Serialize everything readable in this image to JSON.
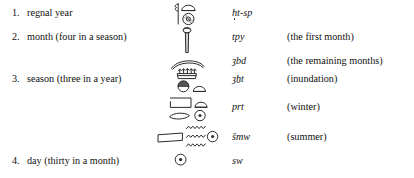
{
  "document": {
    "title": "Egyptian calendrical terms",
    "background_color": "#ffffff",
    "ink_color": "#2b2b2b"
  },
  "entries": [
    {
      "number": "1.",
      "label": "regnal year",
      "translit": "ḥȝt-sp",
      "translit_parts": {
        "base1": "h",
        "base2": "ȝ",
        "tail": "t-sp"
      },
      "gloss": "",
      "glyph_name": "palm-rib-with-sun-and-bread-glyph"
    },
    {
      "number": "2.",
      "label": "month (four in a season)",
      "translit": "tpy",
      "gloss": "(the first month)",
      "glyph_name": "crescent-on-pole-glyph"
    },
    {
      "number": "",
      "label": "",
      "translit": "ȝbd",
      "gloss": "(the remaining months)",
      "glyph_name": "crescent-moon-glyph"
    },
    {
      "number": "3.",
      "label": "season (three in a year)",
      "translit": "ȝẖt",
      "gloss": "(inundation)",
      "glyph_name": "inundation-marsh-glyph"
    },
    {
      "number": "",
      "label": "",
      "translit": "prt",
      "gloss": "(winter)",
      "glyph_name": "house-and-bread-glyph"
    },
    {
      "number": "",
      "label": "",
      "translit": "šmw",
      "gloss": "(summer)",
      "glyph_name": "garden-and-water-glyph"
    },
    {
      "number": "4.",
      "label": "day (thirty in a month)",
      "translit": "sw",
      "gloss": "",
      "glyph_name": "sun-disc-glyph"
    }
  ]
}
